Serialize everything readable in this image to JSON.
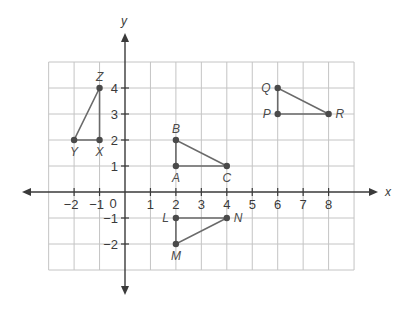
{
  "diagram": {
    "type": "coordinate-plane",
    "x_axis": {
      "label": "x",
      "range": [
        -3,
        9
      ],
      "tick_labels": [
        "−2",
        "−1",
        "0",
        "1",
        "2",
        "3",
        "4",
        "5",
        "6",
        "7",
        "8"
      ],
      "tick_values": [
        -2,
        -1,
        0,
        1,
        2,
        3,
        4,
        5,
        6,
        7,
        8
      ]
    },
    "y_axis": {
      "label": "y",
      "range": [
        -3,
        5
      ],
      "tick_labels": [
        "4",
        "3",
        "2",
        "1",
        "−1",
        "−2"
      ],
      "tick_values": [
        4,
        3,
        2,
        1,
        -1,
        -2
      ]
    },
    "origin_label": "0",
    "grid": true,
    "colors": {
      "grid": "#c4c4c4",
      "axis": "#3a3a3a",
      "edge": "#6a6a6a",
      "vertex": "#4a4a4a"
    },
    "triangles": [
      {
        "name": "XYZ",
        "vertices": [
          {
            "label": "X",
            "x": -1,
            "y": 2,
            "label_pos": "below"
          },
          {
            "label": "Y",
            "x": -2,
            "y": 2,
            "label_pos": "below"
          },
          {
            "label": "Z",
            "x": -1,
            "y": 4,
            "label_pos": "above"
          }
        ]
      },
      {
        "name": "ABC",
        "vertices": [
          {
            "label": "A",
            "x": 2,
            "y": 1,
            "label_pos": "below"
          },
          {
            "label": "B",
            "x": 2,
            "y": 2,
            "label_pos": "above"
          },
          {
            "label": "C",
            "x": 4,
            "y": 1,
            "label_pos": "below"
          }
        ]
      },
      {
        "name": "PQR",
        "vertices": [
          {
            "label": "P",
            "x": 6,
            "y": 3,
            "label_pos": "left"
          },
          {
            "label": "Q",
            "x": 6,
            "y": 4,
            "label_pos": "left"
          },
          {
            "label": "R",
            "x": 8,
            "y": 3,
            "label_pos": "right"
          }
        ]
      },
      {
        "name": "LMN",
        "vertices": [
          {
            "label": "L",
            "x": 2,
            "y": -1,
            "label_pos": "left"
          },
          {
            "label": "M",
            "x": 2,
            "y": -2,
            "label_pos": "below"
          },
          {
            "label": "N",
            "x": 4,
            "y": -1,
            "label_pos": "right"
          }
        ]
      }
    ]
  }
}
